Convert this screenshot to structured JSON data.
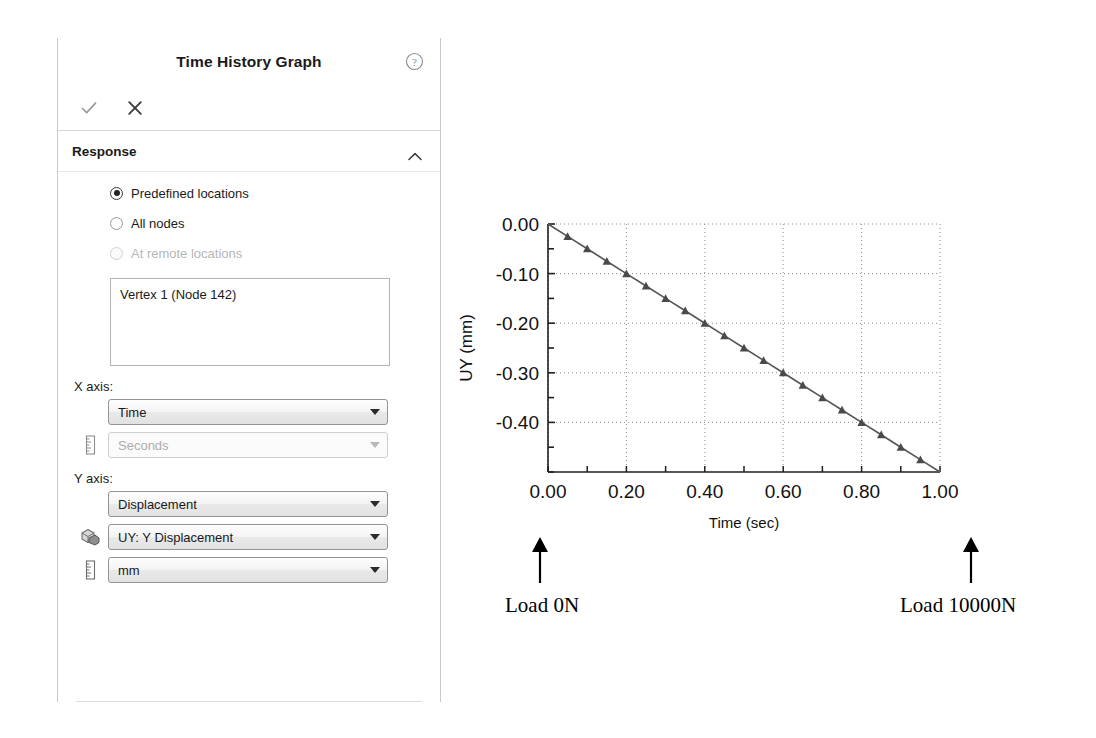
{
  "panel": {
    "title": "Time History Graph",
    "help_icon": "help-circle-icon",
    "toolbar": {
      "accept_label": "✓",
      "cancel_label": "✕"
    },
    "sections": [
      {
        "title": "Response",
        "collapsed": false,
        "radios": [
          {
            "label": "Predefined locations",
            "checked": true,
            "disabled": false
          },
          {
            "label": "All nodes",
            "checked": false,
            "disabled": false
          },
          {
            "label": "At remote locations",
            "checked": false,
            "disabled": true
          }
        ],
        "locations_list": [
          "Vertex 1 (Node 142)"
        ],
        "x_axis_label": "X axis:",
        "x_axis_quantity": {
          "value": "Time",
          "disabled": false,
          "icon": null
        },
        "x_axis_unit": {
          "value": "Seconds",
          "disabled": true,
          "icon": "ruler-icon"
        },
        "y_axis_label": "Y axis:",
        "y_axis_quantity": {
          "value": "Displacement",
          "disabled": false,
          "icon": null
        },
        "y_axis_component": {
          "value": "UY: Y Displacement",
          "disabled": false,
          "icon": "component-cube-icon"
        },
        "y_axis_unit": {
          "value": "mm",
          "disabled": false,
          "icon": "ruler-icon"
        }
      }
    ]
  },
  "annotations": {
    "left_text": "Load 0N",
    "right_text": "Load 10000N",
    "left_arrow_icon": "up-arrow-icon",
    "right_arrow_icon": "up-arrow-icon"
  },
  "chart_data": {
    "type": "line",
    "title": "",
    "xlabel": "Time (sec)",
    "ylabel": "UY (mm)",
    "xlim": [
      0.0,
      1.0
    ],
    "ylim": [
      -0.5,
      0.0
    ],
    "xticks": [
      0.0,
      0.1,
      0.2,
      0.3,
      0.4,
      0.5,
      0.6,
      0.7,
      0.8,
      0.9,
      1.0
    ],
    "xtick_labels": [
      "0.00",
      "",
      "0.20",
      "",
      "0.40",
      "",
      "0.60",
      "",
      "0.80",
      "",
      "1.00"
    ],
    "yticks": [
      0.0,
      -0.05,
      -0.1,
      -0.15,
      -0.2,
      -0.25,
      -0.3,
      -0.35,
      -0.4,
      -0.45,
      -0.5
    ],
    "ytick_labels": [
      "0.00",
      "",
      "-0.10",
      "",
      "-0.20",
      "",
      "-0.30",
      "",
      "-0.40",
      "",
      ""
    ],
    "grid": true,
    "grid_style": "dotted",
    "legend": false,
    "marker": "triangle",
    "line_color": "#555555",
    "series": [
      {
        "name": "UY",
        "x": [
          0.0,
          0.05,
          0.1,
          0.15,
          0.2,
          0.25,
          0.3,
          0.35,
          0.4,
          0.45,
          0.5,
          0.55,
          0.6,
          0.65,
          0.7,
          0.75,
          0.8,
          0.85,
          0.9,
          0.95,
          1.0
        ],
        "y": [
          0.0,
          -0.025,
          -0.05,
          -0.075,
          -0.1,
          -0.125,
          -0.15,
          -0.175,
          -0.2,
          -0.225,
          -0.25,
          -0.275,
          -0.3,
          -0.325,
          -0.35,
          -0.375,
          -0.4,
          -0.425,
          -0.45,
          -0.475,
          -0.5
        ]
      }
    ]
  }
}
